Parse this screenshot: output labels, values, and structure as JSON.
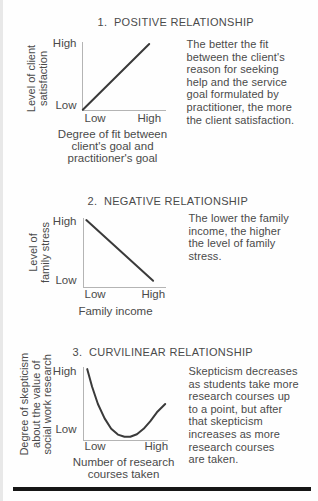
{
  "figure": {
    "kind": "textbook-relationship-diagrams",
    "colors": {
      "background": "#fefefe",
      "text": "#4a4a4a",
      "axis": "#b4b4b4",
      "data_line": "#3a3a3a",
      "bottom_rule": "#161616"
    }
  },
  "chart_data": [
    {
      "type": "line",
      "title": "1.  POSITIVE RELATIONSHIP",
      "ylabel": "Level of client\nsatisfaction",
      "xlabel": "Degree of fit between\nclient's goal and\npractitioner's goal",
      "y_ticks": [
        "Low",
        "High"
      ],
      "x_ticks": [
        "Low",
        "High"
      ],
      "x_range": [
        "Low",
        "High"
      ],
      "y_range": [
        "Low",
        "High"
      ],
      "grid": false,
      "legend": "none",
      "points": [
        [
          0.01,
          0.005
        ],
        [
          0.8,
          0.97
        ]
      ],
      "annotation": "The better the fit\nbetween the client's\nreason for seeking\nhelp and the service\ngoal formulated by\npractitioner, the more\nthe client satisfaction."
    },
    {
      "type": "line",
      "title": "2.  NEGATIVE RELATIONSHIP",
      "ylabel": "Level of\nfamily stress",
      "xlabel": "Family income",
      "y_ticks": [
        "Low",
        "High"
      ],
      "x_ticks": [
        "Low",
        "High"
      ],
      "x_range": [
        "Low",
        "High"
      ],
      "y_range": [
        "Low",
        "High"
      ],
      "grid": false,
      "legend": "none",
      "points": [
        [
          0.04,
          0.97
        ],
        [
          0.845,
          0.09
        ]
      ],
      "annotation": "The lower the family\nincome, the higher\nthe level of family\nstress."
    },
    {
      "type": "line",
      "title": "3.  CURVILINEAR RELATIONSHIP",
      "ylabel": "Degree of skepticism\nabout the value of\nsocial work research",
      "xlabel": "Number of research\ncourses taken",
      "y_ticks": [
        "Low",
        "High"
      ],
      "x_ticks": [
        "Low",
        "High"
      ],
      "x_range": [
        "Low",
        "High"
      ],
      "y_range": [
        "Low",
        "High"
      ],
      "grid": false,
      "legend": "none",
      "points": [
        [
          0.05,
          0.985
        ],
        [
          0.11,
          0.74
        ],
        [
          0.18,
          0.5
        ],
        [
          0.26,
          0.3
        ],
        [
          0.34,
          0.155
        ],
        [
          0.42,
          0.075
        ],
        [
          0.5,
          0.045
        ],
        [
          0.57,
          0.045
        ],
        [
          0.65,
          0.08
        ],
        [
          0.73,
          0.155
        ],
        [
          0.81,
          0.26
        ],
        [
          0.89,
          0.385
        ],
        [
          0.99,
          0.5
        ]
      ],
      "annotation": "Skepticism decreases\nas students take more\nresearch courses up\nto a point, but after\nthat skepticism\nincreases as more\nresearch courses\nare taken."
    }
  ]
}
